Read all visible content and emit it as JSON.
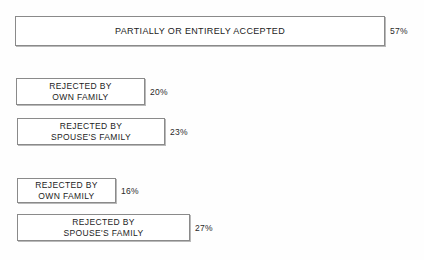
{
  "chart_data": {
    "type": "bar",
    "title": "",
    "xlabel": "",
    "ylabel": "",
    "orientation": "horizontal",
    "grid": false,
    "legend": false,
    "value_suffix": "%",
    "xlim": [
      0,
      60
    ],
    "categories": [
      "PARTIALLY OR ENTIRELY ACCEPTED",
      "REJECTED BY\nOWN FAMILY",
      "REJECTED BY\nSPOUSE'S FAMILY",
      "REJECTED BY\nOWN FAMILY",
      "REJECTED BY\nSPOUSE'S FAMILY"
    ],
    "values": [
      57,
      20,
      23,
      16,
      27
    ],
    "value_labels": [
      "57%",
      "20%",
      "23%",
      "16%",
      "27%"
    ],
    "bars": [
      {
        "label": "PARTIALLY OR ENTIRELY ACCEPTED",
        "value": 57,
        "value_label": "57%"
      },
      {
        "label": "REJECTED BY\nOWN FAMILY",
        "value": 20,
        "value_label": "20%"
      },
      {
        "label": "REJECTED BY\nSPOUSE'S FAMILY",
        "value": 23,
        "value_label": "23%"
      },
      {
        "label": "REJECTED BY\nOWN FAMILY",
        "value": 16,
        "value_label": "16%"
      },
      {
        "label": "REJECTED BY\nSPOUSE'S FAMILY",
        "value": 27,
        "value_label": "27%"
      }
    ],
    "colors": {
      "background": "#fefefe",
      "bar_fill": "#ffffff",
      "bar_border": "#8a8a8a",
      "bar_shadow": "#b9b9b9",
      "label_text": "#1c1c1c",
      "value_text": "#2a2a2a"
    }
  }
}
